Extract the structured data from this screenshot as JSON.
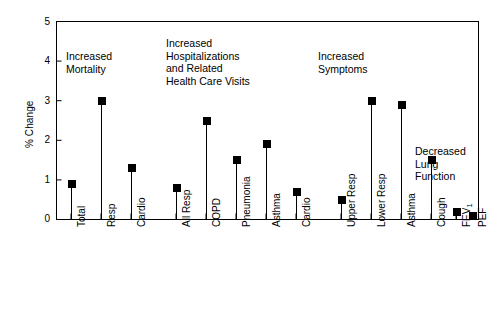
{
  "chart_data": {
    "type": "scatter",
    "title": "",
    "xlabel": "",
    "ylabel": "% Change",
    "ylim": [
      0,
      5
    ],
    "yticks": [
      0,
      1,
      2,
      3,
      4,
      5
    ],
    "ytick_labels": [
      "0",
      "1",
      "2",
      "3",
      "4",
      "5"
    ],
    "grid": false,
    "legend": "none",
    "marker_style": "filled-square-with-stem-to-zero",
    "categories": [
      "Total",
      "Resp",
      "Cardio",
      "All Resp",
      "COPD",
      "Pneumonia",
      "Asthma",
      "Cardio",
      "Upper Resp",
      "Lower Resp",
      "Asthma",
      "Cough",
      "FEV1",
      "PEF"
    ],
    "category_labels": [
      "Total",
      "Resp",
      "Cardio",
      "All Resp",
      "COPD",
      "Pneumonia",
      "Asthma",
      "Cardio",
      "Upper Resp",
      "Lower Resp",
      "Asthma",
      "Cough",
      "FEV₁",
      "PEF"
    ],
    "values": [
      0.9,
      3.0,
      1.3,
      0.8,
      2.5,
      1.5,
      1.9,
      0.7,
      0.5,
      3.0,
      2.9,
      1.5,
      0.2,
      0.1
    ],
    "groups": [
      {
        "name": "Increased Mortality",
        "categories": [
          "Total",
          "Resp",
          "Cardio"
        ],
        "values": [
          0.9,
          3.0,
          1.3
        ]
      },
      {
        "name": "Increased Hospitalizations and Related Health Care Visits",
        "categories": [
          "All Resp",
          "COPD",
          "Pneumonia",
          "Asthma",
          "Cardio"
        ],
        "values": [
          0.8,
          2.5,
          1.5,
          1.9,
          0.7
        ]
      },
      {
        "name": "Increased Symptoms",
        "categories": [
          "Upper Resp",
          "Lower Resp",
          "Asthma",
          "Cough"
        ],
        "values": [
          0.5,
          3.0,
          2.9,
          1.5
        ]
      },
      {
        "name": "Decreased Lung Function",
        "categories": [
          "FEV₁",
          "PEF"
        ],
        "values": [
          0.2,
          0.1
        ]
      }
    ],
    "annotations": [
      {
        "id": "ann-mortality",
        "lines": [
          "Increased",
          "Mortality"
        ],
        "x": 66,
        "y": 50
      },
      {
        "id": "ann-hospitalizations",
        "lines": [
          "Increased",
          "Hospitalizations",
          "and Related",
          "Health Care Visits"
        ],
        "x": 166,
        "y": 37
      },
      {
        "id": "ann-symptoms",
        "lines": [
          "Increased",
          "Symptoms"
        ],
        "x": 318,
        "y": 50
      },
      {
        "id": "ann-lung-function",
        "lines": [
          "Decreased",
          "Lung",
          "Function"
        ],
        "x": 415,
        "y": 145
      }
    ],
    "colors": {
      "marker": "#000000",
      "stem": "#000000",
      "axis": "#000000",
      "background": "#ffffff",
      "text": "#000000"
    }
  },
  "axis": {
    "y_title": "% Change"
  }
}
